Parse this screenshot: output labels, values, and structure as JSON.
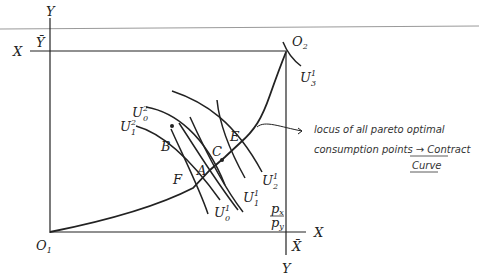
{
  "diagram": {
    "type": "edgeworth-box",
    "origins": {
      "consumer1": {
        "label": "O",
        "sub": "1"
      },
      "consumer2": {
        "label": "O",
        "sub": "2"
      }
    },
    "axes": {
      "left_top_Y": "Y",
      "left_Ybar": "Ȳ",
      "left_X": "X",
      "right_X": "X",
      "bottom_Xbar": "X̄",
      "bottom_Y": "Y"
    },
    "points": [
      "A",
      "B",
      "C",
      "E",
      "F"
    ],
    "indifference_curves": [
      {
        "label": "U",
        "sup": "2",
        "sub": "0"
      },
      {
        "label": "U",
        "sup": "2",
        "sub": "1"
      },
      {
        "label": "U",
        "sup": "1",
        "sub": "0"
      },
      {
        "label": "U",
        "sup": "1",
        "sub": "1"
      },
      {
        "label": "U",
        "sup": "1",
        "sub": "2"
      },
      {
        "label": "U",
        "sup": "1",
        "sub": "3"
      }
    ],
    "price_ratio": {
      "numerator": "p",
      "numerator_sub": "x",
      "denominator": "p",
      "denominator_sub": "y"
    },
    "annotation": {
      "line1": "locus of all pareto optimal",
      "line2": "consumption points → Contract",
      "line3": "Curve"
    },
    "colors": {
      "ink": "#222222",
      "rule": "#9a9a9a"
    }
  }
}
